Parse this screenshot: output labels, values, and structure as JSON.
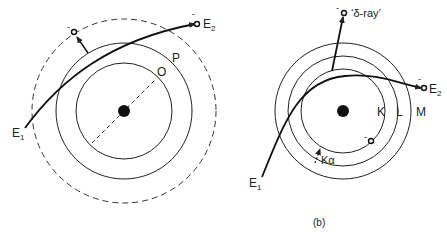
{
  "left_diagram": {
    "shells": [
      {
        "label": "O",
        "radius": 48,
        "style": "solid"
      },
      {
        "label": "P",
        "radius": 68,
        "style": "solid"
      },
      {
        "label": "",
        "radius": 92,
        "style": "dashed"
      }
    ],
    "incoming_label": "E",
    "incoming_sub": "1",
    "outgoing_label": "E",
    "outgoing_sub": "2",
    "electron_charge": "-"
  },
  "right_diagram": {
    "shells": [
      {
        "label": "K",
        "radius": 42
      },
      {
        "label": "L",
        "radius": 55
      },
      {
        "label": "M",
        "radius": 68
      }
    ],
    "incoming_label": "E",
    "incoming_sub": "1",
    "outgoing_label": "E",
    "outgoing_sub": "2",
    "delta_ray_label": "‘δ-ray’",
    "transition_label": "Kα",
    "electron_charge": "-",
    "caption": "(b)"
  },
  "colors": {
    "stroke": "#222222",
    "background": "#ffffff"
  }
}
